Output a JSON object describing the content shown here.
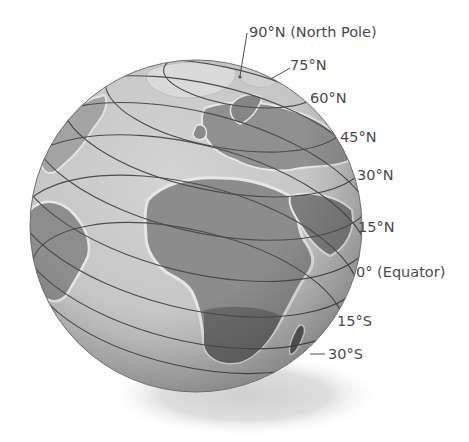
{
  "diagram": {
    "colors": {
      "ocean": "#c9c9c9",
      "land": "#8f8f8f",
      "land_dark": "#6a6a6a",
      "coast_highlight": "#e6e6e6",
      "ice": "#dcdcdc",
      "line": "#4d4d4d",
      "label": "#4a4a4a",
      "shadow": "#d4d4d4"
    },
    "labels": [
      {
        "id": "lat-90n",
        "text": "90°N (North Pole)"
      },
      {
        "id": "lat-75n",
        "text": "75°N"
      },
      {
        "id": "lat-60n",
        "text": "60°N"
      },
      {
        "id": "lat-45n",
        "text": "45°N"
      },
      {
        "id": "lat-30n",
        "text": "30°N"
      },
      {
        "id": "lat-15n",
        "text": "15°N"
      },
      {
        "id": "lat-0",
        "text": "0° (Equator)"
      },
      {
        "id": "lat-15s",
        "text": "15°S"
      },
      {
        "id": "lat-30s",
        "text": "30°S"
      }
    ]
  }
}
